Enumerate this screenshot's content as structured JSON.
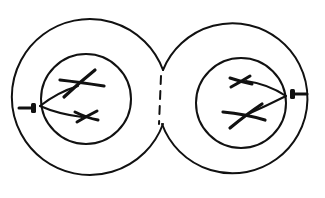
{
  "diagram": {
    "type": "cell-division-schematic",
    "colors": {
      "line": "#111111",
      "background": "#ffffff"
    },
    "cells": [
      {
        "id": "left-cell",
        "outer": {
          "cx": 95,
          "cy": 97,
          "r": 78
        },
        "nucleus": {
          "cx": 86,
          "cy": 99,
          "r": 45
        },
        "spindle_pole": {
          "x1": 20,
          "y1": 108,
          "x2": 36,
          "y2": 108
        },
        "chromosomes": [
          {
            "label": "large-chromosome",
            "cx": 80,
            "cy": 84
          },
          {
            "label": "small-chromosome",
            "cx": 87,
            "cy": 117
          }
        ]
      },
      {
        "id": "right-cell",
        "outer": {
          "cx": 236,
          "cy": 105,
          "r": 75
        },
        "nucleus": {
          "cx": 241,
          "cy": 103,
          "r": 45
        },
        "spindle_pole": {
          "x1": 290,
          "y1": 94,
          "x2": 306,
          "y2": 94
        },
        "chromosomes": [
          {
            "label": "small-chromosome",
            "cx": 242,
            "cy": 81
          },
          {
            "label": "large-chromosome",
            "cx": 245,
            "cy": 115
          }
        ]
      }
    ],
    "division_furrow": {
      "x": 161,
      "y1": 70,
      "y2": 124,
      "style": "dashed"
    }
  }
}
